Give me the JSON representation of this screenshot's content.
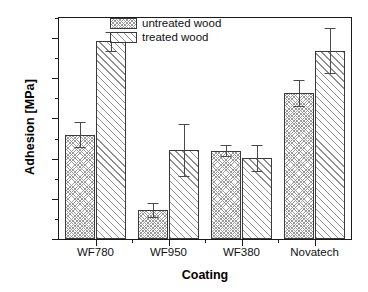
{
  "chart_data": {
    "type": "bar",
    "title": "",
    "xlabel": "Coating",
    "ylabel": "Adhesion [MPa]",
    "categories": [
      "WF780",
      "WF950",
      "WF380",
      "Novatech"
    ],
    "ylim": [
      0.0,
      2.75
    ],
    "ytick_labels": [
      "0.0",
      "0.5",
      "1.0",
      "1.5",
      "2.0",
      "2.5"
    ],
    "ytick_values": [
      0.0,
      0.5,
      1.0,
      1.5,
      2.0,
      2.5
    ],
    "yminor_values": [
      0.25,
      0.75,
      1.25,
      1.75,
      2.25,
      2.5,
      2.75
    ],
    "grid": false,
    "legend_position": "top-center",
    "series": [
      {
        "name": "untreated wood",
        "pattern": "cross-hatch",
        "values": [
          1.3,
          0.36,
          1.1,
          1.82
        ],
        "errors": [
          0.15,
          0.09,
          0.07,
          0.16
        ]
      },
      {
        "name": "treated wood",
        "pattern": "diagonal-hatch",
        "values": [
          2.46,
          1.11,
          1.01,
          2.34
        ],
        "errors": [
          0.12,
          0.32,
          0.16,
          0.28
        ]
      }
    ]
  },
  "legend": {
    "items": [
      {
        "label": "untreated wood"
      },
      {
        "label": "treated wood"
      }
    ]
  },
  "colors": {
    "axis": "#1a1a1a",
    "bar_edge": "#3a3a3a",
    "hatch": "#9a9a9a",
    "error": "#4a4a4a",
    "background": "#ffffff"
  }
}
